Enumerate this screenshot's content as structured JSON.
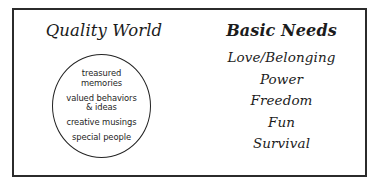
{
  "diagram": {
    "type": "concept-diagram",
    "background_color": "#ffffff",
    "border_color": "#2b2b2b",
    "text_color": "#1c1c1c",
    "left_panel": {
      "heading": "Quality World",
      "circle": {
        "shape": "circle",
        "items": [
          "treasured\nmemories",
          "valued behaviors\n& ideas",
          "creative musings",
          "special people"
        ]
      }
    },
    "right_panel": {
      "heading": "Basic Needs",
      "items": [
        "Love/Belonging",
        "Power",
        "Freedom",
        "Fun",
        "Survival"
      ]
    }
  }
}
